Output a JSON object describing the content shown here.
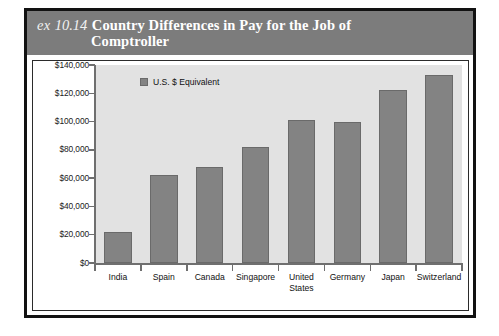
{
  "exhibit": {
    "label_prefix": "ex",
    "number": "10.14",
    "title_line1": "Country Differences in Pay for the Job of",
    "title_line2": "Comptroller"
  },
  "legend": {
    "swatch_name": "legend-swatch-gray",
    "label": "U.S. $ Equivalent"
  },
  "colors": {
    "bar_fill": "#838383",
    "bar_stroke": "#6a6a6a",
    "plot_background": "#e2e2e2",
    "caption_band": "#7c7c7c",
    "frame": "#121212",
    "axis": "#6f6f6f"
  },
  "chart_data": {
    "type": "bar",
    "title": "Country Differences in Pay for the Job of Comptroller",
    "subtitle": "",
    "xlabel": "",
    "ylabel": "",
    "legend": [
      "U.S. $ Equivalent"
    ],
    "legend_position": "top-left inside plot",
    "grid": false,
    "ylim": [
      0,
      140000
    ],
    "ytick_step": 20000,
    "ytick_labels": [
      "$0",
      "$20,000",
      "$40,000",
      "$60,000",
      "$80,000",
      "$100,000",
      "$120,000",
      "$140,000"
    ],
    "ytick_values": [
      0,
      20000,
      40000,
      60000,
      80000,
      100000,
      120000,
      140000
    ],
    "categories": [
      "India",
      "Spain",
      "Canada",
      "Singapore",
      "United States",
      "Germany",
      "Japan",
      "Switzerland"
    ],
    "category_labels_wrapped": [
      [
        "India"
      ],
      [
        "Spain"
      ],
      [
        "Canada"
      ],
      [
        "Singapore"
      ],
      [
        "United",
        "States"
      ],
      [
        "Germany"
      ],
      [
        "Japan"
      ],
      [
        "Switzerland"
      ]
    ],
    "series": [
      {
        "name": "U.S. $ Equivalent",
        "values": [
          22000,
          62000,
          68000,
          82000,
          101000,
          100000,
          122000,
          133000
        ]
      }
    ]
  }
}
